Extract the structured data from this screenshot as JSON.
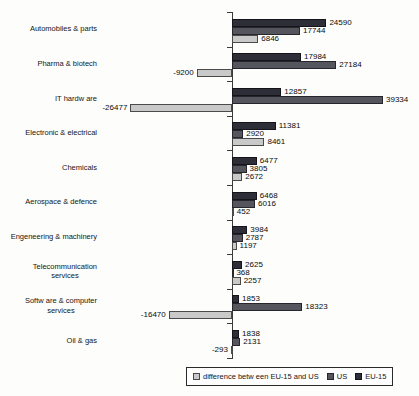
{
  "chart_data": {
    "type": "bar",
    "orientation": "horizontal",
    "title": "",
    "xlabel": "",
    "ylabel": "",
    "xlim": [
      -30000,
      45000
    ],
    "grid": false,
    "categories": [
      "Automobiles & parts",
      "Pharma & biotech",
      "IT hardw are",
      "Electronic & electrical",
      "Chemicals",
      "Aerospace & defence",
      "Engeneering & machinery",
      "Telecommunication\nservices",
      "Softw are & computer\nservices",
      "Oil & gas"
    ],
    "series": [
      {
        "name": "EU-15",
        "color": "#2e2e38",
        "border_color": "#14141a",
        "values": [
          24590,
          17984,
          12857,
          11381,
          6477,
          6468,
          3984,
          2625,
          1853,
          1838
        ]
      },
      {
        "name": "US",
        "color": "#55555e",
        "border_color": "#26262c",
        "values": [
          17744,
          27184,
          39334,
          2920,
          3805,
          6016,
          2787,
          368,
          18323,
          2131
        ]
      },
      {
        "name": "difference between EU-15 and US",
        "color": "#c9c9c9",
        "border_color": "#4a4a4a",
        "values": [
          6846,
          -9200,
          -26477,
          8461,
          2672,
          452,
          1197,
          2257,
          -16470,
          -293
        ]
      }
    ],
    "legend": {
      "position": "bottom",
      "items": [
        {
          "label": "difference betw een EU-15 and US",
          "color": "#c9c9c9",
          "border_color": "#4a4a4a"
        },
        {
          "label": "US",
          "color": "#55555e",
          "border_color": "#26262c"
        },
        {
          "label": "EU-15",
          "color": "#2e2e38",
          "border_color": "#14141a"
        }
      ]
    }
  }
}
